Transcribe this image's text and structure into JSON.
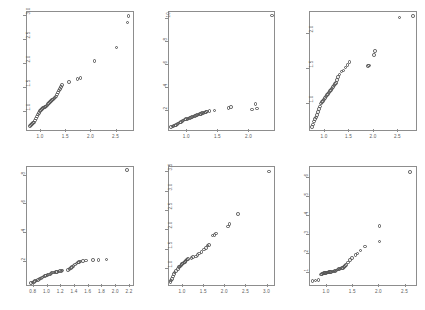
{
  "figure": {
    "type": "scatter-grid",
    "rows": 2,
    "columns": 3,
    "marker": "open-circle",
    "marker_color": "#555555",
    "frame_color": "#8d8d8d",
    "background": "#ffffff",
    "tick_label_color": "#5a5a5a"
  },
  "chart_data": [
    {
      "type": "scatter",
      "title": "",
      "xlabel": "",
      "ylabel": "",
      "xlim": [
        0.72,
        2.82
      ],
      "ylim": [
        0.62,
        3.08
      ],
      "xticks": [
        "1.0",
        "1.5",
        "2.0",
        "2.5"
      ],
      "xtick_values": [
        1.0,
        1.5,
        2.0,
        2.5
      ],
      "yticks": [
        "1.0",
        "1.5",
        "2.0",
        "2.5",
        "3.0"
      ],
      "ytick_values": [
        1.0,
        1.5,
        2.0,
        2.5,
        3.0
      ],
      "grid": false,
      "legend": "none",
      "x": [
        0.78,
        0.8,
        0.82,
        0.84,
        0.86,
        0.88,
        0.9,
        0.92,
        0.94,
        0.96,
        0.98,
        1.0,
        1.02,
        1.04,
        1.06,
        1.08,
        1.1,
        1.12,
        1.14,
        1.16,
        1.18,
        1.2,
        1.22,
        1.24,
        1.26,
        1.28,
        1.3,
        1.32,
        1.34,
        1.36,
        1.38,
        1.4,
        1.42,
        1.56,
        1.72,
        1.78,
        2.06,
        2.5,
        2.72,
        2.74
      ],
      "y": [
        0.7,
        0.72,
        0.74,
        0.76,
        0.78,
        0.82,
        0.86,
        0.9,
        0.94,
        0.98,
        1.02,
        1.04,
        1.06,
        1.08,
        1.09,
        1.1,
        1.11,
        1.13,
        1.16,
        1.18,
        1.2,
        1.22,
        1.24,
        1.26,
        1.28,
        1.3,
        1.32,
        1.36,
        1.4,
        1.44,
        1.48,
        1.52,
        1.56,
        1.62,
        1.68,
        1.7,
        2.06,
        2.34,
        2.86,
        3.0
      ]
    },
    {
      "type": "scatter",
      "title": "",
      "xlabel": "",
      "ylabel": "",
      "xlim": [
        0.7,
        2.4
      ],
      "ylim": [
        0.3,
        10.6
      ],
      "xticks": [
        "1.0",
        "1.5",
        "2.0"
      ],
      "xtick_values": [
        1.0,
        1.5,
        2.0
      ],
      "yticks": [
        "2",
        "4",
        "6",
        "8",
        "10"
      ],
      "ytick_values": [
        2,
        4,
        6,
        8,
        10
      ],
      "grid": false,
      "legend": "none",
      "x": [
        0.74,
        0.76,
        0.78,
        0.8,
        0.82,
        0.84,
        0.86,
        0.88,
        0.9,
        0.92,
        0.94,
        0.96,
        0.98,
        1.0,
        1.02,
        1.04,
        1.06,
        1.08,
        1.1,
        1.12,
        1.14,
        1.16,
        1.18,
        1.2,
        1.22,
        1.24,
        1.26,
        1.28,
        1.3,
        1.32,
        1.36,
        1.44,
        1.66,
        1.7,
        2.04,
        2.12,
        2.1,
        2.36
      ],
      "y": [
        0.55,
        0.6,
        0.65,
        0.7,
        0.75,
        0.8,
        0.88,
        0.95,
        1.02,
        1.08,
        1.14,
        1.2,
        1.24,
        1.28,
        1.32,
        1.36,
        1.4,
        1.44,
        1.48,
        1.52,
        1.56,
        1.6,
        1.64,
        1.68,
        1.72,
        1.76,
        1.8,
        1.84,
        1.88,
        1.92,
        1.96,
        2.0,
        2.2,
        2.3,
        2.1,
        2.18,
        2.56,
        10.3
      ]
    },
    {
      "type": "scatter",
      "title": "",
      "xlabel": "",
      "ylabel": "",
      "xlim": [
        0.7,
        2.86
      ],
      "ylim": [
        0.62,
        2.32
      ],
      "xticks": [
        "1.0",
        "1.5",
        "2.0",
        "2.5"
      ],
      "xtick_values": [
        1.0,
        1.5,
        2.0,
        2.5
      ],
      "yticks": [
        "1.0",
        "1.5",
        "2.0"
      ],
      "ytick_values": [
        1.0,
        1.5,
        2.0
      ],
      "grid": false,
      "legend": "none",
      "x": [
        0.74,
        0.76,
        0.78,
        0.8,
        0.82,
        0.84,
        0.86,
        0.88,
        0.9,
        0.92,
        0.94,
        0.96,
        0.98,
        1.0,
        1.02,
        1.04,
        1.06,
        1.08,
        1.1,
        1.12,
        1.14,
        1.16,
        1.18,
        1.2,
        1.22,
        1.24,
        1.26,
        1.3,
        1.34,
        1.38,
        1.42,
        1.46,
        1.5,
        1.88,
        1.9,
        2.0,
        2.02,
        2.52,
        2.8
      ],
      "y": [
        0.66,
        0.7,
        0.74,
        0.78,
        0.8,
        0.84,
        0.88,
        0.92,
        0.96,
        1.0,
        1.02,
        1.04,
        1.06,
        1.08,
        1.1,
        1.12,
        1.14,
        1.16,
        1.18,
        1.2,
        1.22,
        1.24,
        1.26,
        1.28,
        1.3,
        1.34,
        1.38,
        1.42,
        1.46,
        1.48,
        1.52,
        1.56,
        1.6,
        1.54,
        1.55,
        1.7,
        1.76,
        2.24,
        2.26
      ]
    },
    {
      "type": "scatter",
      "title": "",
      "xlabel": "",
      "ylabel": "",
      "xlim": [
        0.7,
        2.24
      ],
      "ylim": [
        0.4,
        8.6
      ],
      "xticks": [
        "0.8",
        "1.0",
        "1.2",
        "1.4",
        "1.6",
        "1.8",
        "2.0",
        "2.2"
      ],
      "xtick_values": [
        0.8,
        1.0,
        1.2,
        1.4,
        1.6,
        1.8,
        2.0,
        2.2
      ],
      "yticks": [
        "2",
        "4",
        "6",
        "8"
      ],
      "ytick_values": [
        2,
        4,
        6,
        8
      ],
      "grid": false,
      "legend": "none",
      "x": [
        0.76,
        0.78,
        0.8,
        0.82,
        0.84,
        0.86,
        0.88,
        0.9,
        0.92,
        0.94,
        0.96,
        0.98,
        1.0,
        1.02,
        1.04,
        1.06,
        1.08,
        1.1,
        1.12,
        1.14,
        1.16,
        1.18,
        1.2,
        1.22,
        1.3,
        1.32,
        1.34,
        1.36,
        1.38,
        1.4,
        1.42,
        1.44,
        1.46,
        1.48,
        1.52,
        1.56,
        1.66,
        1.74,
        1.86,
        2.16
      ],
      "y": [
        0.55,
        0.58,
        0.62,
        0.66,
        0.7,
        0.74,
        0.8,
        0.86,
        0.92,
        0.98,
        1.02,
        1.06,
        1.1,
        1.14,
        1.18,
        1.22,
        1.26,
        1.28,
        1.3,
        1.32,
        1.34,
        1.36,
        1.38,
        1.4,
        1.44,
        1.5,
        1.58,
        1.66,
        1.74,
        1.82,
        1.9,
        1.96,
        2.0,
        2.04,
        2.06,
        2.1,
        2.12,
        2.14,
        2.18,
        8.4
      ]
    },
    {
      "type": "scatter",
      "title": "",
      "xlabel": "",
      "ylabel": "",
      "xlim": [
        0.66,
        3.16
      ],
      "ylim": [
        0.58,
        3.64
      ],
      "xticks": [
        "1.0",
        "1.5",
        "2.0",
        "2.5",
        "3.0"
      ],
      "xtick_values": [
        1.0,
        1.5,
        2.0,
        2.5,
        3.0
      ],
      "yticks": [
        "1.0",
        "1.5",
        "2.0",
        "2.5",
        "3.0",
        "3.5"
      ],
      "ytick_values": [
        1.0,
        1.5,
        2.0,
        2.5,
        3.0,
        3.5
      ],
      "grid": false,
      "legend": "none",
      "x": [
        0.7,
        0.72,
        0.74,
        0.76,
        0.78,
        0.8,
        0.84,
        0.88,
        0.9,
        0.92,
        0.94,
        0.96,
        0.98,
        1.0,
        1.02,
        1.04,
        1.06,
        1.08,
        1.1,
        1.12,
        1.2,
        1.24,
        1.3,
        1.34,
        1.38,
        1.44,
        1.5,
        1.54,
        1.58,
        1.62,
        1.7,
        1.74,
        1.78,
        2.06,
        2.1,
        2.3,
        3.04
      ],
      "y": [
        0.66,
        0.7,
        0.74,
        0.8,
        0.86,
        0.9,
        0.94,
        1.0,
        1.04,
        1.06,
        1.08,
        1.1,
        1.12,
        1.14,
        1.16,
        1.18,
        1.2,
        1.22,
        1.24,
        1.26,
        1.28,
        1.3,
        1.32,
        1.36,
        1.4,
        1.44,
        1.5,
        1.54,
        1.6,
        1.62,
        1.86,
        1.88,
        1.92,
        2.1,
        2.16,
        2.42,
        3.52
      ]
    },
    {
      "type": "scatter",
      "title": "",
      "xlabel": "",
      "ylabel": "",
      "xlim": [
        0.68,
        2.7
      ],
      "ylim": [
        0.4,
        6.55
      ],
      "xticks": [
        "1.0",
        "1.5",
        "2.0",
        "2.5"
      ],
      "xtick_values": [
        1.0,
        1.5,
        2.0,
        2.5
      ],
      "yticks": [
        "1",
        "2",
        "3",
        "4",
        "5",
        "6"
      ],
      "ytick_values": [
        1,
        2,
        3,
        4,
        5,
        6
      ],
      "grid": false,
      "legend": "none",
      "x": [
        0.72,
        0.78,
        0.84,
        0.88,
        0.9,
        0.92,
        0.94,
        0.96,
        0.98,
        1.0,
        1.02,
        1.04,
        1.06,
        1.08,
        1.1,
        1.12,
        1.14,
        1.16,
        1.18,
        1.2,
        1.22,
        1.24,
        1.26,
        1.28,
        1.3,
        1.32,
        1.34,
        1.36,
        1.4,
        1.44,
        1.48,
        1.54,
        1.58,
        1.64,
        1.72,
        2.0,
        2.0,
        2.58
      ],
      "y": [
        0.62,
        0.64,
        0.66,
        0.95,
        0.98,
        1.0,
        1.02,
        1.03,
        1.04,
        1.05,
        1.06,
        1.07,
        1.08,
        1.09,
        1.1,
        1.11,
        1.12,
        1.13,
        1.16,
        1.2,
        1.22,
        1.24,
        1.26,
        1.28,
        1.3,
        1.34,
        1.4,
        1.44,
        1.58,
        1.7,
        1.8,
        1.96,
        2.04,
        2.2,
        2.4,
        2.66,
        3.46,
        6.3
      ]
    }
  ]
}
